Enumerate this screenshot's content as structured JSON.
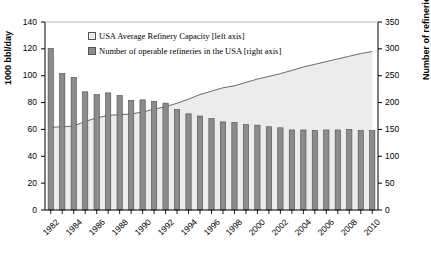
{
  "chart_data": {
    "type": "bar",
    "title": "",
    "subtitle": "",
    "xlabel": "",
    "ylabel": "1000 bbl/day",
    "ylabel_right": "Number of refineries",
    "grid": false,
    "legend_position": "top-center",
    "xlim": [
      1981.5,
      2010.5
    ],
    "ylim": [
      0,
      140
    ],
    "ylim_right": [
      0,
      350
    ],
    "yticks": [
      0,
      20,
      40,
      60,
      80,
      100,
      120,
      140
    ],
    "yticks_right": [
      0,
      50,
      100,
      150,
      200,
      250,
      300,
      350
    ],
    "x": [
      1982,
      1983,
      1984,
      1985,
      1986,
      1987,
      1988,
      1989,
      1990,
      1991,
      1992,
      1993,
      1994,
      1995,
      1996,
      1997,
      1998,
      1999,
      2000,
      2001,
      2002,
      2003,
      2004,
      2005,
      2006,
      2007,
      2008,
      2009,
      2010
    ],
    "xtick_labels": [
      "1982",
      "1984",
      "1986",
      "1988",
      "1990",
      "1992",
      "1994",
      "1996",
      "1998",
      "2000",
      "2002",
      "2004",
      "2006",
      "2008",
      "2010"
    ],
    "series": [
      {
        "name": "Number of operable refineries in the USA [right axis]",
        "axis": "right",
        "render": "bar",
        "color": "#8c8c8c",
        "values": [
          301,
          254,
          247,
          220,
          215,
          218,
          213,
          204,
          205,
          202,
          199,
          187,
          179,
          175,
          170,
          164,
          163,
          159,
          158,
          155,
          153,
          149,
          149,
          148,
          149,
          149,
          150,
          148,
          148
        ]
      },
      {
        "name": "USA Average Refinery Capacity [left axis]",
        "axis": "left",
        "render": "area",
        "color": "#ececec",
        "values": [
          61.5,
          62.0,
          62.5,
          66.0,
          68.5,
          70.5,
          71.0,
          71.5,
          73.0,
          75.0,
          77.0,
          79.5,
          82.5,
          86.0,
          88.5,
          91.0,
          92.5,
          95.0,
          97.5,
          99.5,
          101.5,
          104.0,
          106.5,
          108.5,
          110.5,
          112.5,
          114.5,
          116.5,
          118.0
        ]
      }
    ],
    "legend": [
      {
        "label": "USA Average Refinery Capacity [left axis]",
        "swatch": "area"
      },
      {
        "label": "Number of operable refineries in the USA [right axis]",
        "swatch": "bar"
      }
    ]
  }
}
